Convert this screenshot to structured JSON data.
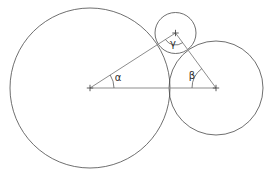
{
  "figure": {
    "background_color": "#ffffff",
    "circle_stroke_color": "#4a4a4a",
    "triangle_stroke_color": "#8d8d8d",
    "label_color": "#2b2b2b",
    "width": 268,
    "height": 175
  },
  "chart_data": {
    "type": "diagram",
    "title": "",
    "circles": [
      {
        "name": "large-circle",
        "cx": 90.0,
        "cy": 88.0,
        "r": 80.0
      },
      {
        "name": "right-circle",
        "cx": 216.0,
        "cy": 88.0,
        "r": 47.0
      },
      {
        "name": "small-circle",
        "cx": 175.5,
        "cy": 33.0,
        "r": 20.5
      }
    ],
    "triangle": {
      "vertices": [
        {
          "name": "vertex-alpha",
          "x": 90.0,
          "y": 88.0
        },
        {
          "name": "vertex-beta",
          "x": 216.0,
          "y": 88.0
        },
        {
          "name": "vertex-gamma",
          "x": 175.5,
          "y": 33.0
        }
      ],
      "edges": [
        {
          "from": "vertex-alpha",
          "to": "vertex-beta"
        },
        {
          "from": "vertex-alpha",
          "to": "vertex-gamma"
        },
        {
          "from": "vertex-beta",
          "to": "vertex-gamma"
        }
      ]
    },
    "angles": [
      {
        "name": "alpha",
        "label": "α",
        "vertex": "vertex-alpha",
        "label_x": 118,
        "label_y": 78,
        "arc_radius": 24
      },
      {
        "name": "beta",
        "label": "β",
        "vertex": "vertex-beta",
        "label_x": 192,
        "label_y": 76,
        "arc_radius": 24
      },
      {
        "name": "gamma",
        "label": "γ",
        "vertex": "vertex-gamma",
        "label_x": 173,
        "label_y": 44,
        "arc_radius": 12
      }
    ],
    "center_markers": [
      {
        "name": "large-circle-center",
        "x": 90.0,
        "y": 88.0
      },
      {
        "name": "right-circle-center",
        "x": 216.0,
        "y": 88.0
      },
      {
        "name": "small-circle-center",
        "x": 175.5,
        "y": 33.0
      }
    ]
  },
  "labels": {
    "alpha": "α",
    "beta": "β",
    "gamma": "γ"
  }
}
